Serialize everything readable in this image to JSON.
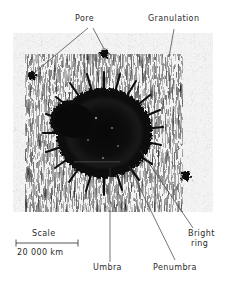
{
  "figure": {
    "kind": "annotated-photograph",
    "panel": {
      "x": 13,
      "y": 33,
      "width": 200,
      "height": 179
    }
  },
  "labels": {
    "pore": "Pore",
    "granulation": "Granulation",
    "umbra": "Umbra",
    "penumbra": "Penumbra",
    "bright_ring_line1": "Bright",
    "bright_ring_line2": "ring",
    "scale_title": "Scale",
    "scale_value": "20 000 km"
  },
  "colors": {
    "ink": "#2b2b2b",
    "leader": "#3a3a3a",
    "background": "#ffffff",
    "umbra": "#0a0a0a",
    "penumbra": "#141414",
    "photosphere": "#d9d9d9"
  },
  "scale_bar": {
    "x1": 16,
    "x2": 78,
    "y": 243
  },
  "features": {
    "pores": [
      {
        "cx": 32,
        "cy": 76,
        "r": 4.2
      },
      {
        "cx": 104,
        "cy": 53,
        "r": 4.6
      }
    ],
    "small_spot": {
      "cx": 186,
      "cy": 176,
      "r": 5.0
    },
    "sunspot": {
      "cx": 104,
      "cy": 133,
      "umbra_r": 36,
      "penumbra_r": 56
    }
  },
  "leaders": [
    {
      "name": "pore-left",
      "x1": 88,
      "y1": 28,
      "x2": 34,
      "y2": 73
    },
    {
      "name": "pore-right",
      "x1": 93,
      "y1": 28,
      "x2": 104,
      "y2": 49
    },
    {
      "name": "granulation",
      "x1": 174,
      "y1": 29,
      "x2": 169,
      "y2": 57
    },
    {
      "name": "umbra",
      "x1": 110,
      "y1": 262,
      "x2": 110,
      "y2": 168
    },
    {
      "name": "penumbra",
      "x1": 175,
      "y1": 260,
      "x2": 129,
      "y2": 166
    },
    {
      "name": "bright-ring",
      "x1": 193,
      "y1": 228,
      "x2": 140,
      "y2": 150
    }
  ]
}
